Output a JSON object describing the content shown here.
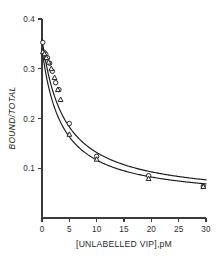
{
  "figure": {
    "background": "#ffffff",
    "ink_color": "#1a1a1a",
    "axis_color": "#3b3b3b"
  },
  "chart_data": {
    "type": "scatter",
    "title": "",
    "subtitle": "",
    "xlabel": "[UNLABELLED VIP],pM",
    "ylabel": "BOUND/TOTAL",
    "xlim": [
      0,
      30
    ],
    "ylim": [
      0,
      0.4
    ],
    "grid": false,
    "legend": null,
    "legend_position": "none",
    "xticks": [
      0,
      5,
      10,
      15,
      20,
      25,
      30
    ],
    "xtick_labels": [
      "0",
      "5",
      "10",
      "15",
      "20",
      "25",
      "30"
    ],
    "yticks": [
      0.1,
      0.2,
      0.3,
      0.4
    ],
    "ytick_labels": [
      "0.1",
      "0.2",
      "0.3",
      "0.4"
    ],
    "series": [
      {
        "name": "series-circles",
        "marker": "open-circle",
        "x": [
          0.15,
          0.4,
          0.7,
          1.0,
          1.4,
          1.9,
          2.5,
          3.1,
          5.0,
          10.0,
          19.5,
          29.5
        ],
        "y": [
          0.353,
          0.333,
          0.329,
          0.322,
          0.311,
          0.295,
          0.272,
          0.258,
          0.19,
          0.124,
          0.085,
          0.064
        ],
        "fit_curve": {
          "model": "hyperbolic",
          "top": 0.36,
          "bottom": 0.038,
          "ic50": 4.1
        }
      },
      {
        "name": "series-triangles",
        "marker": "open-triangle",
        "x": [
          0.15,
          0.45,
          0.8,
          1.2,
          1.7,
          2.3,
          2.9,
          3.4,
          5.0,
          10.0,
          19.5,
          29.5
        ],
        "y": [
          0.334,
          0.33,
          0.322,
          0.313,
          0.3,
          0.282,
          0.258,
          0.238,
          0.168,
          0.118,
          0.079,
          0.063
        ],
        "fit_curve": {
          "model": "hyperbolic",
          "top": 0.34,
          "bottom": 0.036,
          "ic50": 3.6
        }
      }
    ]
  }
}
